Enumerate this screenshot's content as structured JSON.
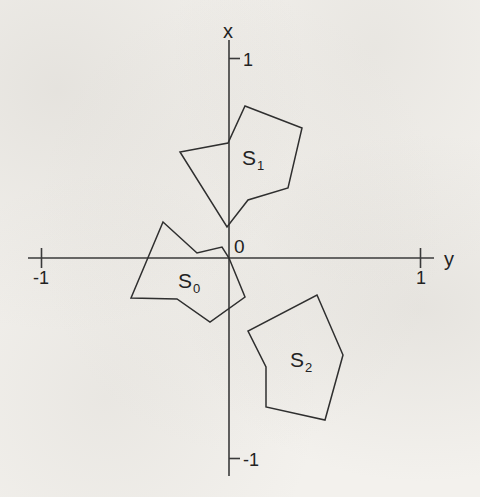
{
  "figure": {
    "background_color": "#f3f1ed",
    "stroke_color": "#2f2f2f",
    "axis_color": "#3a3a3a",
    "axes": {
      "vertical": {
        "name": "x",
        "name_label": "x",
        "tick_labels": [
          "1",
          "-1"
        ],
        "tick_top_label": "1",
        "tick_bottom_label": "-1"
      },
      "horizontal": {
        "name": "y",
        "name_label": "y",
        "tick_labels": [
          "-1",
          "1"
        ],
        "tick_left_label": "-1",
        "tick_right_label": "1"
      },
      "origin_label": "0"
    },
    "shapes": [
      {
        "id": "S0",
        "label_base": "S",
        "label_sub": "0",
        "label_x": 178,
        "label_y": 288,
        "points": "163,222 197,253 222,247 229,258 245,297 210,322 177,299 131,298",
        "vertices": [
          [
            163,
            222
          ],
          [
            197,
            253
          ],
          [
            222,
            247
          ],
          [
            229,
            258
          ],
          [
            245,
            297
          ],
          [
            210,
            322
          ],
          [
            177,
            299
          ],
          [
            131,
            298
          ]
        ]
      },
      {
        "id": "S1",
        "label_base": "S",
        "label_sub": "1",
        "label_x": 242,
        "label_y": 165,
        "points": "245,106 302,128 288,188 248,200 227,227 180,152 228,143",
        "vertices": [
          [
            245,
            106
          ],
          [
            302,
            128
          ],
          [
            288,
            188
          ],
          [
            248,
            200
          ],
          [
            227,
            227
          ],
          [
            180,
            152
          ],
          [
            228,
            143
          ]
        ]
      },
      {
        "id": "S2",
        "label_base": "S",
        "label_sub": "2",
        "label_x": 290,
        "label_y": 367,
        "points": "317,295 343,355 325,420 266,407 266,367 248,331",
        "vertices": [
          [
            317,
            295
          ],
          [
            343,
            355
          ],
          [
            325,
            420
          ],
          [
            266,
            407
          ],
          [
            266,
            367
          ],
          [
            248,
            331
          ]
        ]
      }
    ]
  }
}
